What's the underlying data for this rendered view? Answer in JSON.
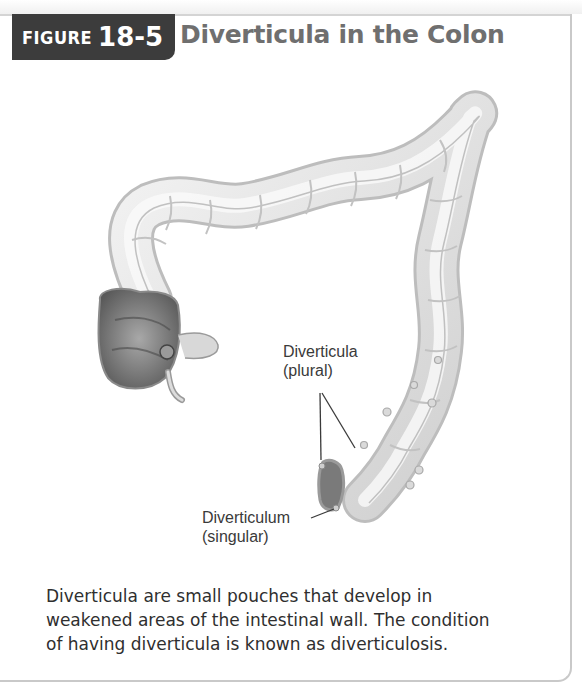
{
  "figure": {
    "badge_word": "FIGURE",
    "badge_number": "18-5",
    "title": "Diverticula in the Colon"
  },
  "illustration": {
    "subject": "colon-illustration",
    "labels": {
      "plural_line1": "Diverticula",
      "plural_line2": "(plural)",
      "singular_line1": "Diverticulum",
      "singular_line2": "(singular)"
    }
  },
  "caption": {
    "lines": [
      "Diverticula are small pouches that develop in",
      "weakened areas of the intestinal wall. The condition",
      "of having diverticula is known as diverticulosis."
    ]
  },
  "colors": {
    "badge_bg": "#3c3c3c",
    "title_text": "#6f6f6f",
    "border": "#c9c9c9",
    "caption_text": "#2f2f2f"
  }
}
